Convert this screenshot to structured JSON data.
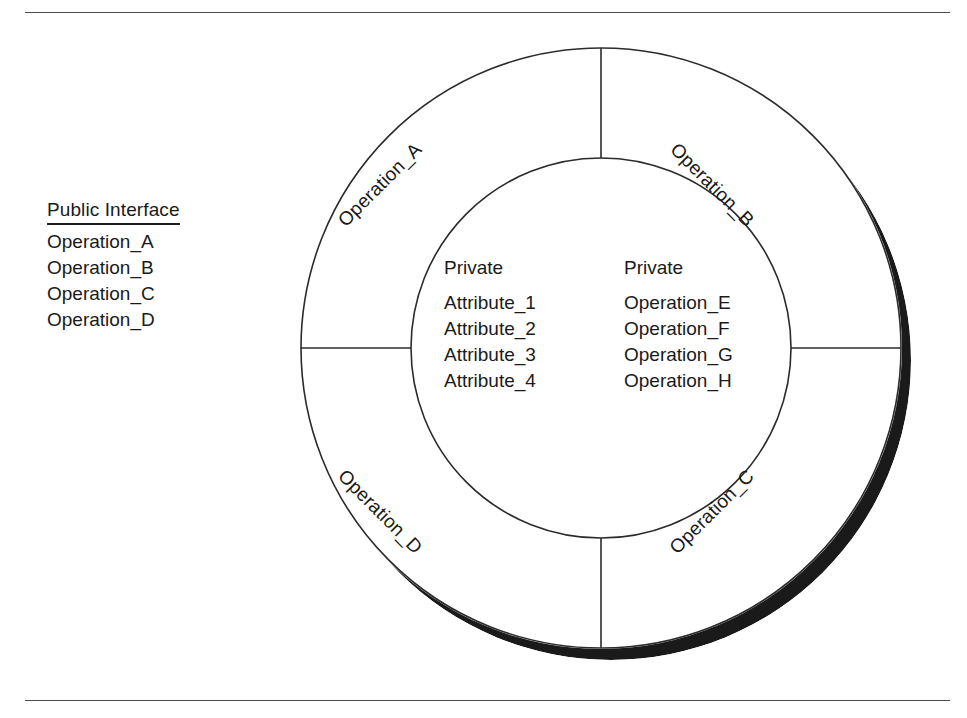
{
  "figure": {
    "type": "concentric-ring-class-diagram",
    "center": {
      "x": 601,
      "y": 348
    },
    "outer_radius": 300,
    "inner_radius": 190,
    "shadow": {
      "color": "#1a1a1a",
      "offset_x": 10,
      "offset_y": 12,
      "description": "offset drop shadow on outer ring, thickest at lower-right"
    },
    "stroke_color": "#2b2b2b",
    "fill_color": "#ffffff",
    "spokes_deg": [
      0,
      90,
      180,
      270
    ]
  },
  "rules": {
    "top_y": 12,
    "bottom_y": 700
  },
  "legend": {
    "title": "Public Interface",
    "items": [
      "Operation_A",
      "Operation_B",
      "Operation_C",
      "Operation_D"
    ]
  },
  "inner": {
    "columns": [
      {
        "heading": "Private",
        "items": [
          "Attribute_1",
          "Attribute_2",
          "Attribute_3",
          "Attribute_4"
        ]
      },
      {
        "heading": "Private",
        "items": [
          "Operation_E",
          "Operation_F",
          "Operation_G",
          "Operation_H"
        ]
      }
    ]
  },
  "ring_labels": [
    {
      "text": "Operation_A",
      "quadrant": "top-left",
      "rotation_deg": -45,
      "x": 380,
      "y": 185
    },
    {
      "text": "Operation_B",
      "quadrant": "top-right",
      "rotation_deg": 45,
      "x": 712,
      "y": 185
    },
    {
      "text": "Operation_C",
      "quadrant": "bottom-right",
      "rotation_deg": -45,
      "x": 712,
      "y": 512
    },
    {
      "text": "Operation_D",
      "quadrant": "bottom-left",
      "rotation_deg": 45,
      "x": 380,
      "y": 512
    }
  ]
}
